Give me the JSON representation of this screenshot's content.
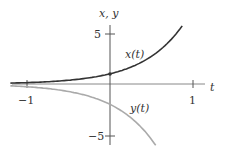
{
  "chart_data": {
    "type": "line",
    "title": "",
    "xlabel": "t",
    "ylabel": "x, y",
    "xlim": [
      -1.2,
      1.25
    ],
    "ylim": [
      -6,
      7
    ],
    "x_ticks": [
      {
        "value": -1,
        "label": "−1"
      },
      {
        "value": 1,
        "label": "1"
      }
    ],
    "y_ticks": [
      {
        "value": 5,
        "label": "5"
      },
      {
        "value": -5,
        "label": "−5"
      }
    ],
    "grid": false,
    "legend": "inline labels",
    "series": [
      {
        "name": "x(t)",
        "label": "x(t)",
        "formula": "e^(2t)",
        "color": "#333333",
        "t_range": [
          -1.2,
          0.87
        ],
        "marked_point": {
          "t": 0,
          "value": 1
        }
      },
      {
        "name": "y(t)",
        "label": "y(t)",
        "formula": "-2e^(2t)",
        "color": "#aaaaaa",
        "t_range": [
          -1.2,
          0.55
        ]
      }
    ]
  },
  "labels": {
    "t_axis": "t",
    "y_axis": "x, y",
    "x_curve": "x(t)",
    "y_curve": "y(t)",
    "tick_neg1": "−1",
    "tick_1": "1",
    "tick_5": "5",
    "tick_neg5": "−5"
  }
}
